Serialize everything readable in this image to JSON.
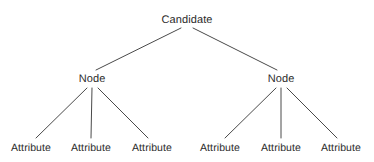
{
  "diagram": {
    "type": "tree",
    "width": 374,
    "height": 162,
    "background_color": "#ffffff",
    "line_color": "#4a4a4a",
    "text_color": "#2b2b2b",
    "root": {
      "label": "Candidate",
      "x": 187,
      "y": 20
    },
    "nodes": [
      {
        "label": "Node",
        "x": 92,
        "y": 79
      },
      {
        "label": "Node",
        "x": 281,
        "y": 79
      }
    ],
    "attributes": [
      {
        "label": "Attribute",
        "x": 31,
        "y": 148
      },
      {
        "label": "Attribute",
        "x": 91,
        "y": 148
      },
      {
        "label": "Attribute",
        "x": 152,
        "y": 148
      },
      {
        "label": "Attribute",
        "x": 220,
        "y": 148
      },
      {
        "label": "Attribute",
        "x": 281,
        "y": 148
      },
      {
        "label": "Attribute",
        "x": 341,
        "y": 148
      }
    ],
    "edges": [
      {
        "from": "root",
        "to": "node-left",
        "x1": 181,
        "y1": 28,
        "x2": 96,
        "y2": 70
      },
      {
        "from": "root",
        "to": "node-right",
        "x1": 193,
        "y1": 28,
        "x2": 277,
        "y2": 70
      },
      {
        "from": "node-left",
        "to": "attribute-1",
        "x1": 87,
        "y1": 88,
        "x2": 36,
        "y2": 138
      },
      {
        "from": "node-left",
        "to": "attribute-2",
        "x1": 92,
        "y1": 88,
        "x2": 91,
        "y2": 138
      },
      {
        "from": "node-left",
        "to": "attribute-3",
        "x1": 98,
        "y1": 88,
        "x2": 148,
        "y2": 138
      },
      {
        "from": "node-right",
        "to": "attribute-4",
        "x1": 276,
        "y1": 88,
        "x2": 225,
        "y2": 138
      },
      {
        "from": "node-right",
        "to": "attribute-5",
        "x1": 281,
        "y1": 88,
        "x2": 281,
        "y2": 138
      },
      {
        "from": "node-right",
        "to": "attribute-6",
        "x1": 287,
        "y1": 88,
        "x2": 337,
        "y2": 138
      }
    ]
  }
}
